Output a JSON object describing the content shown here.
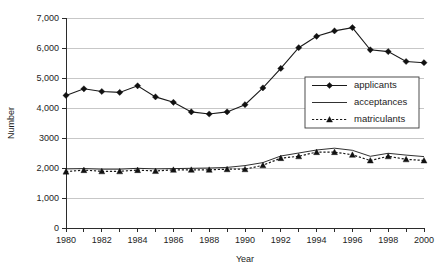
{
  "chart_data": {
    "type": "line",
    "title": "",
    "xlabel": "Year",
    "ylabel": "Number",
    "xlim": [
      1980,
      2000
    ],
    "ylim": [
      0,
      7000
    ],
    "grid": true,
    "legend_position": "center-right",
    "x": [
      1980,
      1981,
      1982,
      1983,
      1984,
      1985,
      1986,
      1987,
      1988,
      1989,
      1990,
      1991,
      1992,
      1993,
      1994,
      1995,
      1996,
      1997,
      1998,
      1999,
      2000
    ],
    "x_tick_labels": [
      "1980",
      "1982",
      "1984",
      "1986",
      "1988",
      "1990",
      "1992",
      "1994",
      "1996",
      "1998",
      "2000"
    ],
    "x_tick_values": [
      1980,
      1982,
      1984,
      1986,
      1988,
      1990,
      1992,
      1994,
      1996,
      1998,
      2000
    ],
    "y_tick_labels": [
      "0",
      "1,000",
      "2,000",
      "3000",
      "4,000",
      "5,000",
      "6,000",
      "7,000"
    ],
    "y_tick_values": [
      0,
      1000,
      2000,
      3000,
      4000,
      5000,
      6000,
      7000
    ],
    "series": [
      {
        "name": "applicants",
        "marker": "diamond",
        "line_style": "solid",
        "values": [
          4420,
          4640,
          4550,
          4520,
          4740,
          4370,
          4190,
          3870,
          3800,
          3870,
          4110,
          4670,
          5320,
          6010,
          6390,
          6570,
          6680,
          5940,
          5880,
          5550,
          5510
        ]
      },
      {
        "name": "acceptances",
        "marker": "none",
        "line_style": "solid-thin",
        "values": [
          1970,
          1980,
          1960,
          1960,
          1990,
          1970,
          1980,
          1990,
          2000,
          2020,
          2080,
          2180,
          2400,
          2500,
          2600,
          2660,
          2590,
          2390,
          2490,
          2430,
          2380
        ]
      },
      {
        "name": "matriculants",
        "marker": "triangle",
        "line_style": "dotted",
        "values": [
          1880,
          1930,
          1890,
          1890,
          1930,
          1900,
          1940,
          1940,
          1940,
          1960,
          1960,
          2090,
          2330,
          2390,
          2530,
          2530,
          2440,
          2250,
          2390,
          2290,
          2250
        ]
      }
    ]
  },
  "legend": {
    "items": [
      {
        "label": "applicants"
      },
      {
        "label": "acceptances"
      },
      {
        "label": "matriculants"
      }
    ]
  },
  "colors": {
    "ink": "#1a1a1a",
    "grid": "#b9b9b9",
    "background": "#ffffff"
  }
}
